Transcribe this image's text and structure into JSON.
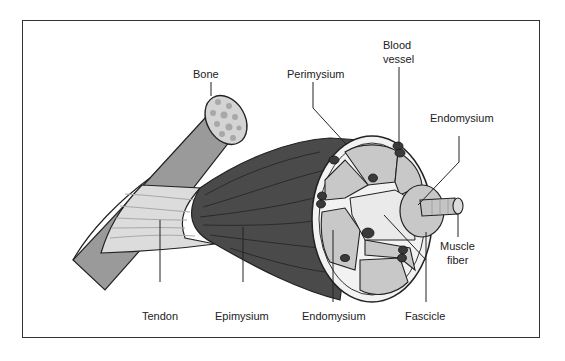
{
  "diagram": {
    "labels": {
      "bone": "Bone",
      "perimysium": "Perimysium",
      "blood_vessel_line1": "Blood",
      "blood_vessel_line2": "vessel",
      "endomysium_top": "Endomysium",
      "muscle_fiber_line1": "Muscle",
      "muscle_fiber_line2": "fiber",
      "tendon": "Tendon",
      "epimysium": "Epimysium",
      "endomysium_bottom": "Endomysium",
      "fascicle": "Fascicle"
    },
    "colors": {
      "bone": "#9a9a9a",
      "bone_end": "#d4d4d4",
      "tendon": "#dcdcdc",
      "muscle": "#4a4a4a",
      "fascicle": "#c8c8c8",
      "sheath": "#f2f2f2",
      "vessel": "#3a3a3a",
      "frame": "#333333"
    }
  }
}
